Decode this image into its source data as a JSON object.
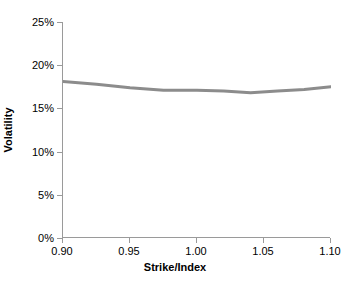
{
  "chart_data": {
    "type": "line",
    "title": "",
    "xlabel": "Strike/Index",
    "ylabel": "Volatility",
    "xlim": [
      0.9,
      1.1
    ],
    "ylim": [
      0,
      25
    ],
    "grid": false,
    "legend": false,
    "y_tick_labels": [
      "25%",
      "20%",
      "15%",
      "10%",
      "5%",
      "0%"
    ],
    "y_tick_values": [
      25,
      20,
      15,
      10,
      5,
      0
    ],
    "x_tick_labels": [
      "0.90",
      "0.95",
      "1.00",
      "1.05",
      "1.10"
    ],
    "x_tick_values": [
      0.9,
      0.95,
      1.0,
      1.05,
      1.1
    ],
    "series": [
      {
        "name": "Implied volatility smile",
        "color": "#8c8c8c",
        "line_width": 3,
        "x": [
          0.9,
          0.925,
          0.95,
          0.975,
          1.0,
          1.02,
          1.04,
          1.06,
          1.08,
          1.1
        ],
        "values": [
          18.1,
          17.8,
          17.4,
          17.1,
          17.1,
          17.0,
          16.8,
          17.0,
          17.2,
          17.5
        ]
      }
    ]
  },
  "axes": {
    "axis_color": "#9a9a9a",
    "text_color": "#000000",
    "background": "#ffffff"
  }
}
